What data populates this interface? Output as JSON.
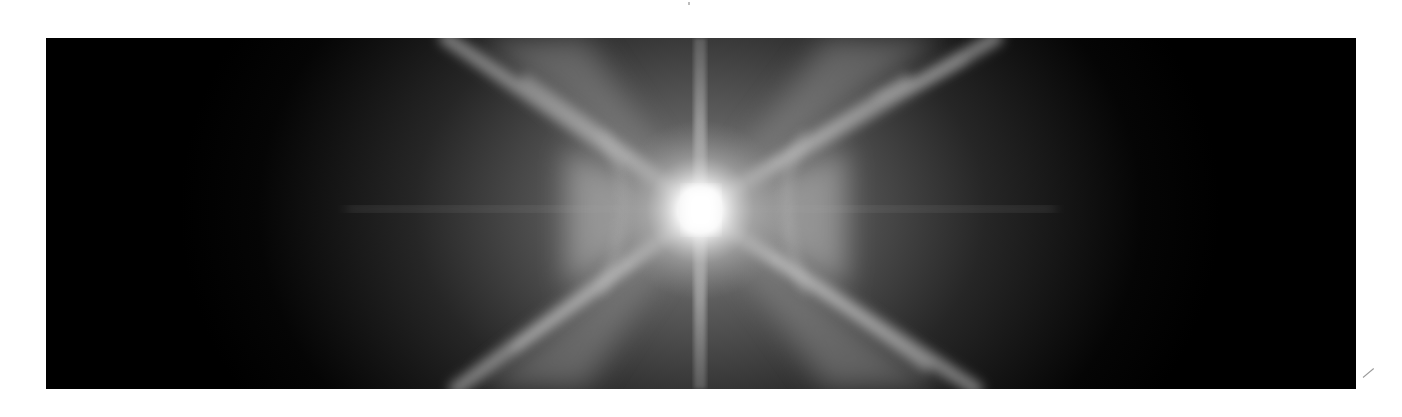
{
  "image": {
    "subject": "nebula",
    "description": "Grayscale astronomical image of a bipolar X-shaped nebula with a bright central star and a vertical diffraction spike",
    "colors": {
      "background": "#ffffff",
      "sky": "#000000",
      "glow": "#d9d9d9",
      "core": "#ffffff"
    }
  }
}
